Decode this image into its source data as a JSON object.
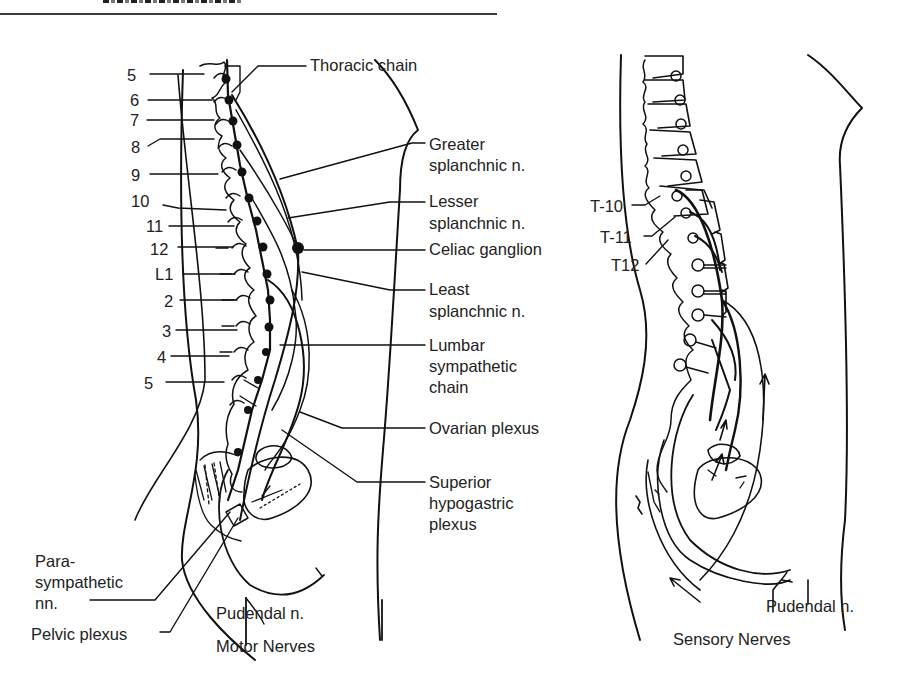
{
  "figure": {
    "header_fragment": "SECTION III: ...",
    "panels": [
      {
        "id": "motor",
        "caption": "Motor Nerves",
        "vertebra_labels": [
          "5",
          "6",
          "7",
          "8",
          "9",
          "10",
          "11",
          "12",
          "L1",
          "2",
          "3",
          "4",
          "5"
        ],
        "labels": {
          "thoracic_chain": "Thoracic chain",
          "greater_splanchnic_1": "Greater",
          "greater_splanchnic_2": "splanchnic n.",
          "lesser_splanchnic_1": "Lesser",
          "lesser_splanchnic_2": "splanchnic n.",
          "celiac_ganglion": "Celiac ganglion",
          "least_splanchnic_1": "Least",
          "least_splanchnic_2": "splanchnic n.",
          "lumbar_chain_1": "Lumbar",
          "lumbar_chain_2": "sympathetic",
          "lumbar_chain_3": "chain",
          "ovarian_plexus": "Ovarian plexus",
          "sup_hypogastric_1": "Superior",
          "sup_hypogastric_2": "hypogastric",
          "sup_hypogastric_3": "plexus",
          "parasympathetic_1": "Para-",
          "parasympathetic_2": "sympathetic",
          "parasympathetic_3": "nn.",
          "pelvic_plexus": "Pelvic plexus",
          "pudendal": "Pudendal n."
        }
      },
      {
        "id": "sensory",
        "caption": "Sensory Nerves",
        "labels": {
          "t10": "T-10",
          "t11": "T-11",
          "t12": "T12",
          "pudendal": "Pudendal n."
        }
      }
    ]
  }
}
